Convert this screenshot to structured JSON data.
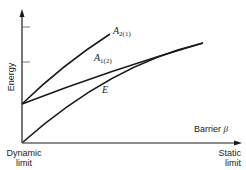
{
  "diagram": {
    "y_axis_label": "Energy",
    "x_axis_label": "Barrier",
    "x_axis_symbol": "β",
    "left_limit": {
      "line1": "Dynamic",
      "line2": "limit"
    },
    "right_limit": {
      "line1": "Static",
      "line2": "limit"
    },
    "curves": [
      {
        "name": "A",
        "sub": "2(1)"
      },
      {
        "name": "A",
        "sub": "1(2)"
      },
      {
        "name": "E",
        "sub": ""
      }
    ],
    "line_color": "#1a1a1a"
  }
}
